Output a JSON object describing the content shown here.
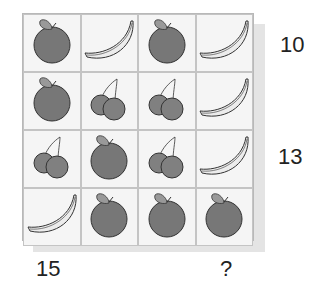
{
  "puzzle": {
    "grid": [
      [
        "apple",
        "banana",
        "apple",
        "banana"
      ],
      [
        "apple",
        "cherries",
        "cherries",
        "banana"
      ],
      [
        "cherries",
        "apple",
        "cherries",
        "banana"
      ],
      [
        "banana",
        "apple",
        "apple",
        "apple"
      ]
    ],
    "row_sums": [
      "10",
      "",
      "13",
      ""
    ],
    "col_sums": [
      "15",
      "",
      "",
      "?"
    ]
  },
  "colors": {
    "apple": "#777777",
    "cherry": "#808080",
    "banana": "#ececec",
    "stroke": "#333333"
  }
}
